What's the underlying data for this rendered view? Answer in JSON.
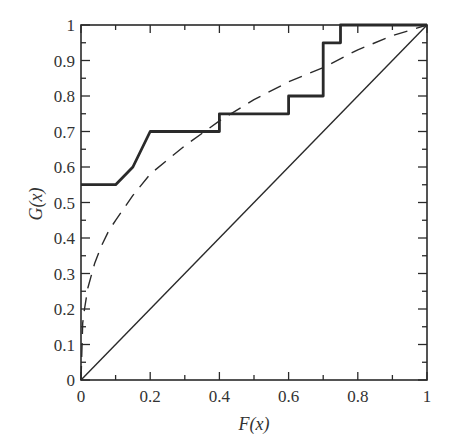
{
  "chart_data": {
    "type": "line",
    "title": "",
    "xlabel": "F(x)",
    "ylabel": "G(x)",
    "xlim": [
      0,
      1
    ],
    "ylim": [
      0,
      1
    ],
    "grid": false,
    "legend": "none",
    "x_ticks": [
      0,
      0.2,
      0.4,
      0.6,
      0.8,
      1
    ],
    "x_tick_labels": [
      "0",
      "0.2",
      "0.4",
      "0.6",
      "0.8",
      "1"
    ],
    "y_ticks": [
      0,
      0.1,
      0.2,
      0.3,
      0.4,
      0.5,
      0.6,
      0.7,
      0.8,
      0.9,
      1
    ],
    "y_tick_labels": [
      "0",
      "0.1",
      "0.2",
      "0.3",
      "0.4",
      "0.5",
      "0.6",
      "0.7",
      "0.8",
      "0.9",
      "1"
    ],
    "series": [
      {
        "name": "step",
        "style": "solid-thick",
        "x": [
          0,
          0.1,
          0.15,
          0.2,
          0.4,
          0.4,
          0.6,
          0.6,
          0.7,
          0.7,
          0.75,
          0.75,
          1
        ],
        "y": [
          0.55,
          0.55,
          0.6,
          0.7,
          0.7,
          0.75,
          0.75,
          0.8,
          0.8,
          0.95,
          0.95,
          1.0,
          1.0
        ]
      },
      {
        "name": "concave",
        "style": "dashed",
        "x": [
          0,
          0.005,
          0.01,
          0.02,
          0.04,
          0.06,
          0.08,
          0.1,
          0.15,
          0.2,
          0.25,
          0.3,
          0.4,
          0.5,
          0.6,
          0.7,
          0.8,
          0.9,
          1
        ],
        "y": [
          0,
          0.16,
          0.2,
          0.26,
          0.33,
          0.38,
          0.42,
          0.45,
          0.52,
          0.58,
          0.62,
          0.66,
          0.73,
          0.79,
          0.84,
          0.88,
          0.93,
          0.97,
          1
        ]
      },
      {
        "name": "diagonal",
        "style": "solid-thin",
        "x": [
          0,
          1
        ],
        "y": [
          0,
          1
        ]
      }
    ]
  }
}
